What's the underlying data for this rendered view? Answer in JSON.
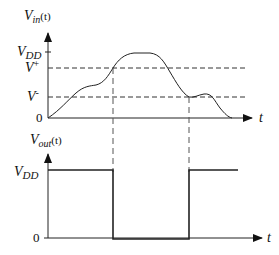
{
  "top_plot": {
    "y_label_main": "V",
    "y_label_sub": "in",
    "y_label_arg": "(t)",
    "x_label": "t",
    "levels": {
      "vdd": {
        "main": "V",
        "sub": "DD"
      },
      "vplus": {
        "main": "V",
        "sup": "+"
      },
      "vminus": {
        "main": "V",
        "sup": "-"
      },
      "zero": "0"
    }
  },
  "bottom_plot": {
    "y_label_main": "V",
    "y_label_sub": "out",
    "y_label_arg": "(t)",
    "x_label": "t",
    "levels": {
      "vdd": {
        "main": "V",
        "sub": "DD"
      },
      "zero": "0"
    }
  },
  "colors": {
    "stroke": "#222222",
    "dash": "#333333",
    "background": "#ffffff"
  }
}
